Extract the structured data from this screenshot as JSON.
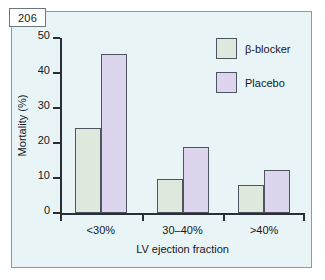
{
  "figure": {
    "number_label": "206"
  },
  "chart_data": {
    "type": "bar",
    "title": "",
    "xlabel": "LV ejection fraction",
    "ylabel": "Mortality (%)",
    "categories": [
      "<30%",
      "30–40%",
      ">40%"
    ],
    "series": [
      {
        "name": "β-blocker",
        "color": "#dfe8dc",
        "values": [
          24.3,
          9.6,
          7.9
        ]
      },
      {
        "name": "Placebo",
        "color": "#ddd4ee",
        "values": [
          45.4,
          18.9,
          12.2
        ]
      }
    ],
    "ylim": [
      0,
      50
    ],
    "yticks": [
      0,
      10,
      20,
      30,
      40,
      50
    ],
    "ytick_labels": [
      "0",
      "10",
      "20",
      "30",
      "40",
      "50"
    ],
    "grid": false,
    "legend_position": "top-right"
  },
  "legend": {
    "entries": [
      {
        "label": "β-blocker"
      },
      {
        "label": "Placebo"
      }
    ]
  }
}
